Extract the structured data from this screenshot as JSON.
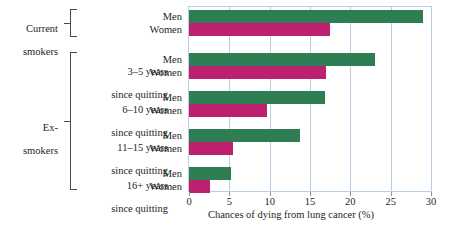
{
  "chart_data": {
    "type": "bar",
    "orientation": "horizontal",
    "title": "",
    "xlabel": "Chances of dying from lung cancer (%)",
    "ylabel": "",
    "xlim": [
      0,
      30
    ],
    "xticks": [
      0,
      5,
      10,
      15,
      20,
      25,
      30
    ],
    "grid": true,
    "legend": "none",
    "categories": [
      "Current smokers",
      "3–5 years since quitting",
      "6–10 years since quitting",
      "11–15 years since quitting",
      "16+ years since quitting"
    ],
    "series": [
      {
        "name": "Men",
        "color": "#2f7d53",
        "values": [
          29.0,
          23.0,
          16.8,
          13.7,
          5.2
        ]
      },
      {
        "name": "Women",
        "color": "#be2070",
        "values": [
          17.5,
          17.0,
          9.7,
          5.4,
          2.6
        ]
      }
    ]
  },
  "groups": [
    {
      "line1": "Current",
      "line2": "smokers",
      "men_label": "Men",
      "women_label": "Women"
    },
    {
      "line1": "3–5 years",
      "line2": "since quitting",
      "men_label": "Men",
      "women_label": "Women"
    },
    {
      "line1": "6–10 years",
      "line2": "since quitting",
      "men_label": "Men",
      "women_label": "Women"
    },
    {
      "line1": "11–15 years",
      "line2": "since quitting",
      "men_label": "Men",
      "women_label": "Women"
    },
    {
      "line1": "16+ years",
      "line2": "since quitting",
      "men_label": "Men",
      "women_label": "Women"
    }
  ],
  "brackets": [
    {
      "line1": "Current",
      "line2": "smokers"
    },
    {
      "line1": "Ex-",
      "line2": "smokers"
    }
  ],
  "axis": {
    "title": "Chances of dying from lung cancer (%)",
    "ticks": [
      "0",
      "5",
      "10",
      "15",
      "20",
      "25",
      "30"
    ]
  },
  "colors": {
    "men": "#2f7d53",
    "women": "#be2070",
    "grid": "#b9cfe4",
    "text": "#231f20"
  }
}
